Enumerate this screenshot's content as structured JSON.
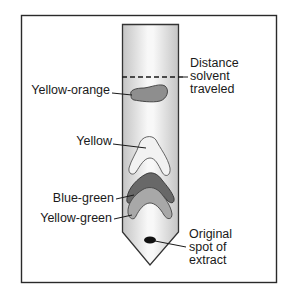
{
  "figure": {
    "colors": {
      "frame": "#2a2a2a",
      "strip_edge": "#3a3a3a",
      "strip_fill_center": "#f7f7f7",
      "strip_fill_edge": "#c9c9c9",
      "yellow_orange": "#8e8e8e",
      "yellow": "#f2f2f2",
      "blue_green": "#6a6a6a",
      "yellow_green": "#a9a9a9",
      "origin_spot": "#111111"
    },
    "labels": {
      "solvent_front": "Distance\nsolvent\ntraveled",
      "yellow_orange": "Yellow-orange",
      "yellow": "Yellow",
      "blue_green": "Blue-green",
      "yellow_green": "Yellow-green",
      "origin": "Original\nspot of\nextract"
    }
  }
}
